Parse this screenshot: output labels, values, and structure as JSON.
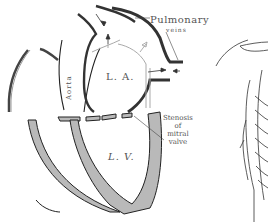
{
  "figure": {
    "labels": {
      "left_atrium": "L. A.",
      "left_ventricle": "L. V.",
      "aorta": "Aorta",
      "pulmonary": "Pulmonary",
      "veins": "veins",
      "stenosis_line1": "Stenosis",
      "stenosis_line2": "of",
      "stenosis_line3": "mitral",
      "stenosis_line4": "valve"
    },
    "colors": {
      "outline": "#2a2a2a",
      "wall_fill": "#b9b9b9",
      "text": "#555555",
      "background": "#ffffff"
    }
  }
}
